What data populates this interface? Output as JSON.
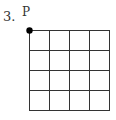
{
  "problem": {
    "number": "3.",
    "point_label": "P",
    "grid": {
      "rows": 4,
      "cols": 4
    },
    "colors": {
      "line": "#333333",
      "dot": "#000000"
    }
  }
}
